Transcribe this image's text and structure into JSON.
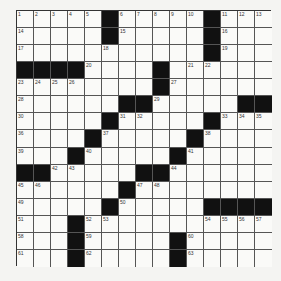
{
  "puzzle": {
    "size": 15,
    "rows": [
      "11111#11111#111",
      "11111#11111#111",
      "11111111111#111",
      "####1111#111111",
      "11111111#111111",
      "111111##11111##",
      "11111#11111#111",
      "1111#11111#1111",
      "111#11111#11111",
      "##11111##111111",
      "111111#11111111",
      "11111#11111####",
      "111#11111111111",
      "111#11111#11111",
      "111#11111#11111"
    ],
    "numbers": {
      "0,0": "1",
      "0,1": "2",
      "0,2": "3",
      "0,3": "4",
      "0,4": "5",
      "0,6": "6",
      "0,7": "7",
      "0,8": "8",
      "0,9": "9",
      "0,10": "10",
      "0,12": "11",
      "0,13": "12",
      "0,14": "13",
      "1,0": "14",
      "1,6": "15",
      "1,12": "16",
      "2,0": "17",
      "2,5": "18",
      "2,12": "19",
      "3,4": "20",
      "3,10": "21",
      "3,11": "22",
      "4,0": "23",
      "4,1": "24",
      "4,2": "25",
      "4,3": "26",
      "4,9": "27",
      "5,0": "28",
      "5,8": "29",
      "6,0": "30",
      "6,6": "31",
      "6,7": "32",
      "6,12": "33",
      "6,13": "34",
      "6,14": "35",
      "7,0": "36",
      "7,5": "37",
      "7,11": "38",
      "8,0": "39",
      "8,4": "40",
      "8,10": "41",
      "9,2": "42",
      "9,3": "43",
      "9,9": "44",
      "10,0": "45",
      "10,1": "46",
      "10,7": "47",
      "10,8": "48",
      "11,0": "49",
      "11,6": "50",
      "12,0": "51",
      "12,4": "52",
      "12,5": "53",
      "12,11": "54",
      "12,12": "55",
      "12,13": "56",
      "12,14": "57",
      "13,0": "58",
      "13,4": "59",
      "13,10": "60",
      "14,0": "61",
      "14,4": "62",
      "14,10": "63"
    }
  }
}
